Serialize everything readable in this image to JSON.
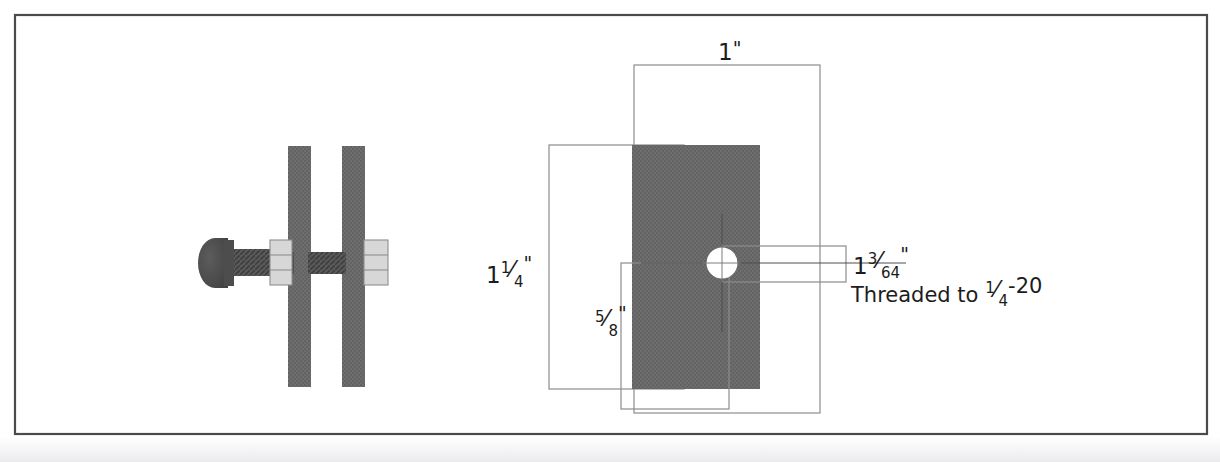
{
  "document": {
    "title": "Bolt and Plate Assembly Dimensioned Drawing",
    "background_color": "#ffffff",
    "frame": {
      "border_color": "#4a4a4a",
      "border_width_px": 2,
      "x": 14,
      "y": 14,
      "width": 1194,
      "height": 421
    }
  },
  "colors": {
    "plate_fill": "#6b6b6b",
    "plate_fill_dark": "#5e5e5e",
    "bolt_fill": "#4f4f4f",
    "bolt_shank": "#565656",
    "nut_fill": "#d5d5d5",
    "nut_stroke": "#8a8a8a",
    "line": "#7a7a7a",
    "centerline": "#5a5a5a",
    "text": "#1c1c1c",
    "hole_fill": "#ffffff"
  },
  "assembly_view": {
    "name": "bolt-through-plates-section-view",
    "description": "Section view of a round head bolt passing through two vertical plates with nuts",
    "plates": [
      {
        "label": "left-plate",
        "x": 288,
        "y": 146,
        "width": 22,
        "height": 240
      },
      {
        "label": "right-plate",
        "x": 342,
        "y": 146,
        "width": 22,
        "height": 240
      }
    ],
    "bolt": {
      "head_cx": 215,
      "head_cy": 262,
      "head_rx": 16,
      "head_ry": 24,
      "shank_x": 213,
      "shank_y": 249,
      "shank_width": 152,
      "shank_height": 26
    },
    "nuts": [
      {
        "label": "nut-left",
        "x": 268,
        "y": 240,
        "width": 22,
        "height": 44,
        "segments": 3
      },
      {
        "label": "nut-right",
        "x": 362,
        "y": 240,
        "width": 24,
        "height": 44,
        "segments": 3
      }
    ]
  },
  "plate_view": {
    "name": "plate-front-view",
    "plate": {
      "x": 632,
      "y": 145,
      "width": 127,
      "height": 244
    },
    "hole": {
      "cx": 722,
      "cy": 263,
      "r": 15,
      "fill": "#ffffff"
    },
    "centerlines": {
      "horizontal": {
        "x1": 642,
        "y1": 263,
        "x2": 905,
        "y2": 263
      },
      "vertical": {
        "x1": 722,
        "y1": 215,
        "x2": 722,
        "y2": 330
      }
    }
  },
  "dimensions": [
    {
      "id": "width-1-inch",
      "name": "dimension-width-1-inch",
      "label_plain": "1\"",
      "whole": "1",
      "numerator": "",
      "denominator": "",
      "unit": "\"",
      "text_x": 727,
      "text_y": 58,
      "box": {
        "x": 634,
        "y": 65,
        "width": 186,
        "height": 348
      }
    },
    {
      "id": "height-1-1-4-inch",
      "name": "dimension-height-1-1-4-inch",
      "label_plain": "1 1/4\"",
      "whole": "1",
      "numerator": "1",
      "denominator": "4",
      "unit": "\"",
      "text_x": 498,
      "text_y": 278,
      "box": {
        "x": 549,
        "y": 145,
        "width": 135,
        "height": 244
      }
    },
    {
      "id": "edge-5-8-inch",
      "name": "dimension-edge-5-8-inch",
      "label_plain": "5/8\"",
      "whole": "",
      "numerator": "5",
      "denominator": "8",
      "unit": "\"",
      "text_x": 604,
      "text_y": 332,
      "box": {
        "x": 621,
        "y": 263,
        "width": 108,
        "height": 146
      }
    },
    {
      "id": "hole-1-3-64-inch",
      "name": "dimension-hole-1-3-64-inch",
      "label_plain": "1 3/64\"",
      "whole": "1",
      "numerator": "3",
      "denominator": "64",
      "unit": "\"",
      "text_x": 855,
      "text_y": 272,
      "box": {
        "x": 722,
        "y": 246,
        "width": 124,
        "height": 36
      }
    }
  ],
  "notes": [
    {
      "id": "thread-note",
      "name": "note-thread-spec",
      "prefix": "Threaded to ",
      "numerator": "1",
      "denominator": "4",
      "suffix": "-20",
      "full_text": "Threaded to 1/4-20",
      "x": 851,
      "y": 300
    }
  ]
}
